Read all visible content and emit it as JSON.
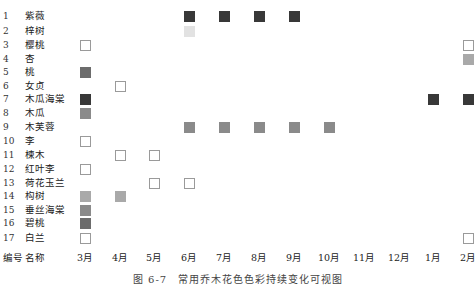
{
  "chart_data": {
    "type": "heatmap",
    "title": "图 6-7　常用乔木花色色彩持续变化可视图",
    "xlabel": "",
    "ylabel": "",
    "header": {
      "number_label": "编号",
      "name_label": "名称"
    },
    "categories": [
      "3月",
      "4月",
      "5月",
      "6月",
      "7月",
      "8月",
      "9月",
      "10月",
      "11月",
      "12月",
      "1月",
      "2月"
    ],
    "legend_colors": {
      "D": "#383838",
      "M": "#6c6c6c",
      "G": "#8a8a8a",
      "L": "#a9a9a9",
      "VL": "#e2e2e2",
      "W": "#ffffff"
    },
    "rows": [
      {
        "id": "1",
        "name": "紫薇",
        "cells": [
          {
            "month": "6月",
            "color": "D"
          },
          {
            "month": "7月",
            "color": "D"
          },
          {
            "month": "8月",
            "color": "D"
          },
          {
            "month": "9月",
            "color": "D"
          }
        ]
      },
      {
        "id": "2",
        "name": "梓树",
        "cells": [
          {
            "month": "6月",
            "color": "VL"
          }
        ]
      },
      {
        "id": "3",
        "name": "樱桃",
        "cells": [
          {
            "month": "3月",
            "color": "W"
          },
          {
            "month": "2月",
            "color": "W"
          }
        ]
      },
      {
        "id": "4",
        "name": "杏",
        "cells": [
          {
            "month": "2月",
            "color": "L"
          }
        ]
      },
      {
        "id": "5",
        "name": "桃",
        "cells": [
          {
            "month": "3月",
            "color": "M"
          }
        ]
      },
      {
        "id": "6",
        "name": "女贞",
        "cells": [
          {
            "month": "4月",
            "color": "W"
          }
        ]
      },
      {
        "id": "7",
        "name": "木瓜海棠",
        "cells": [
          {
            "month": "3月",
            "color": "D"
          },
          {
            "month": "1月",
            "color": "D"
          },
          {
            "month": "2月",
            "color": "D"
          }
        ]
      },
      {
        "id": "8",
        "name": "木瓜",
        "cells": [
          {
            "month": "3月",
            "color": "G"
          }
        ]
      },
      {
        "id": "9",
        "name": "木芙蓉",
        "cells": [
          {
            "month": "6月",
            "color": "G"
          },
          {
            "month": "7月",
            "color": "G"
          },
          {
            "month": "8月",
            "color": "G"
          },
          {
            "month": "9月",
            "color": "G"
          },
          {
            "month": "10月",
            "color": "G"
          }
        ]
      },
      {
        "id": "10",
        "name": "李",
        "cells": [
          {
            "month": "3月",
            "color": "W"
          }
        ]
      },
      {
        "id": "11",
        "name": "楝木",
        "cells": [
          {
            "month": "4月",
            "color": "W"
          },
          {
            "month": "5月",
            "color": "W"
          }
        ]
      },
      {
        "id": "12",
        "name": "红叶李",
        "cells": [
          {
            "month": "3月",
            "color": "W"
          }
        ]
      },
      {
        "id": "13",
        "name": "荷花玉兰",
        "cells": [
          {
            "month": "5月",
            "color": "W"
          },
          {
            "month": "6月",
            "color": "W"
          }
        ]
      },
      {
        "id": "14",
        "name": "构树",
        "cells": [
          {
            "month": "3月",
            "color": "L"
          },
          {
            "month": "4月",
            "color": "L"
          }
        ]
      },
      {
        "id": "15",
        "name": "垂丝海棠",
        "cells": [
          {
            "month": "3月",
            "color": "G"
          }
        ]
      },
      {
        "id": "16",
        "name": "碧桃",
        "cells": [
          {
            "month": "3月",
            "color": "M"
          }
        ]
      },
      {
        "id": "17",
        "name": "白兰",
        "cells": [
          {
            "month": "3月",
            "color": "W"
          },
          {
            "month": "2月",
            "color": "W"
          }
        ]
      }
    ],
    "grid": false,
    "legend_position": "none"
  }
}
